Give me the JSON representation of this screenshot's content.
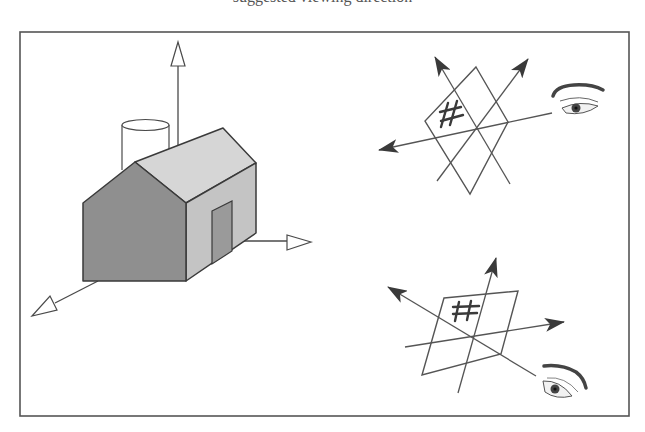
{
  "figure": {
    "caption_fragment": "suggested viewing direction",
    "frame": {
      "x": 20,
      "y": 32,
      "width": 609,
      "height": 384,
      "stroke": "#555555"
    },
    "colors": {
      "line": "#4a4a4a",
      "front_face": "#8f8f8f",
      "roof": "#d6d6d6",
      "side_wall": "#c4c4c4",
      "door": "#9a9a9a",
      "arrow_fill": "#3a3a3a",
      "background": "#ffffff"
    }
  },
  "left_panel": {
    "title": "house-with-3d-axes",
    "objects": [
      "house",
      "chimney-cylinder",
      "vertical-axis-arrow",
      "right-axis-arrow",
      "front-left-axis-arrow",
      "door"
    ]
  },
  "top_right_panel": {
    "title": "plane-with-hash-viewed-from-side",
    "glyph": "#",
    "arrows": [
      "up-left-arrow",
      "up-right-arrow",
      "left-arrow"
    ],
    "viewer": "eye-right"
  },
  "bottom_right_panel": {
    "title": "plane-with-hash-viewed-from-below",
    "glyph": "#",
    "arrows": [
      "up-arrow",
      "up-left-arrow",
      "right-arrow"
    ],
    "viewer": "eye-bottom-right"
  }
}
